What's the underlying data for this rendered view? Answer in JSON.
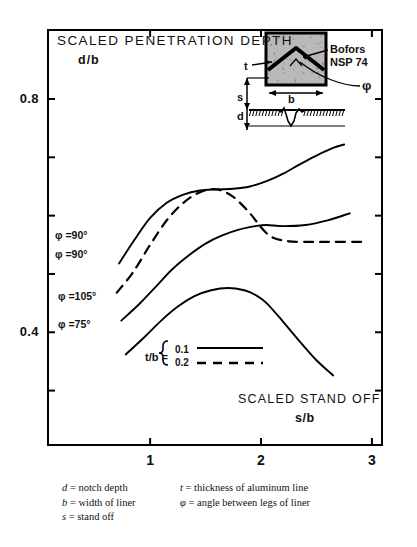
{
  "chart_data": {
    "type": "line",
    "title": "SCALED PENETRATION DEPTH",
    "subtitle": "d/b",
    "ylabel": "d/b",
    "xlabel": "SCALED STAND OFF",
    "xlabel_sub": "s/b",
    "xlim": [
      0.07,
      3.1
    ],
    "ylim": [
      0.205,
      0.92
    ],
    "xticks": [
      1,
      2,
      3
    ],
    "xtick_labels": [
      "1",
      "2",
      "3"
    ],
    "yticks": [
      0.8,
      0.7,
      0.6,
      0.5,
      0.4,
      0.3
    ],
    "ytick_labels": [
      "0.8",
      "",
      "",
      "",
      "0.4",
      ""
    ],
    "grid": false,
    "legend_position": "center-bottom",
    "series": [
      {
        "name": "phi = 90 deg, t/b = 0.1",
        "label": "φ =90°",
        "style": "solid",
        "x": [
          0.72,
          0.85,
          1.0,
          1.15,
          1.3,
          1.45,
          1.6,
          1.75,
          1.9,
          2.05,
          2.2,
          2.35,
          2.5,
          2.65,
          2.75
        ],
        "y": [
          0.518,
          0.556,
          0.596,
          0.622,
          0.636,
          0.643,
          0.645,
          0.646,
          0.65,
          0.659,
          0.672,
          0.688,
          0.703,
          0.716,
          0.722
        ]
      },
      {
        "name": "phi = 90 deg, t/b = 0.2",
        "label": "φ =90°",
        "style": "dashed",
        "x": [
          0.7,
          0.85,
          1.0,
          1.15,
          1.3,
          1.45,
          1.6,
          1.75,
          1.9,
          2.0,
          2.1,
          2.25,
          2.45,
          2.65,
          2.95
        ],
        "y": [
          0.468,
          0.504,
          0.55,
          0.592,
          0.622,
          0.64,
          0.645,
          0.632,
          0.604,
          0.58,
          0.563,
          0.556,
          0.555,
          0.555,
          0.555
        ]
      },
      {
        "name": "phi = 105 deg",
        "label": "φ =105°",
        "style": "solid",
        "x": [
          0.74,
          0.9,
          1.05,
          1.2,
          1.35,
          1.5,
          1.65,
          1.8,
          1.95,
          2.05,
          2.2,
          2.4,
          2.6,
          2.8
        ],
        "y": [
          0.42,
          0.448,
          0.478,
          0.508,
          0.532,
          0.552,
          0.566,
          0.576,
          0.582,
          0.584,
          0.582,
          0.584,
          0.592,
          0.604
        ]
      },
      {
        "name": "phi = 75 deg",
        "label": "φ =75°",
        "style": "solid",
        "x": [
          0.78,
          0.95,
          1.1,
          1.25,
          1.4,
          1.55,
          1.7,
          1.85,
          1.95,
          2.05,
          2.2,
          2.35,
          2.5,
          2.65
        ],
        "y": [
          0.362,
          0.392,
          0.42,
          0.444,
          0.462,
          0.472,
          0.476,
          0.472,
          0.464,
          0.45,
          0.418,
          0.384,
          0.352,
          0.326
        ]
      }
    ],
    "legend": {
      "title": "t/b =",
      "entries": [
        {
          "value": "0.1",
          "style": "solid"
        },
        {
          "value": "0.2",
          "style": "dashed"
        }
      ]
    },
    "annotations": {
      "inset": {
        "device_line1": "Bofors",
        "device_line2": "NSP 74",
        "labels": [
          "t",
          "b",
          "s",
          "d",
          "φ"
        ]
      }
    }
  },
  "footnote": {
    "rows": [
      [
        {
          "sym": "d",
          "def": "= notch depth"
        },
        {
          "sym": "t",
          "def": "= thickness of aluminum line"
        }
      ],
      [
        {
          "sym": "b",
          "def": "= width of liner"
        },
        {
          "sym": "φ",
          "def": "= angle between legs of liner"
        }
      ],
      [
        {
          "sym": "s",
          "def": "= stand off"
        },
        {
          "sym": "",
          "def": ""
        }
      ]
    ]
  }
}
